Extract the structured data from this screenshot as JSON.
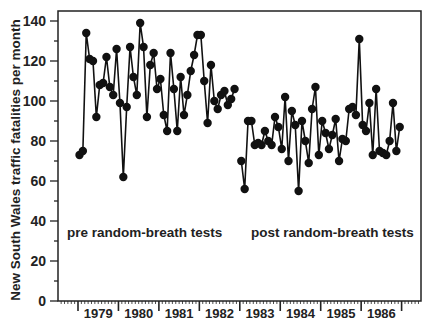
{
  "chart_data": {
    "type": "line",
    "title": "",
    "xlabel": "",
    "ylabel": "New South Wales traffic fatalities per month",
    "ylim": [
      0,
      140
    ],
    "yticks": [
      0,
      20,
      40,
      60,
      80,
      100,
      120,
      140
    ],
    "xticks": [
      "1979",
      "1980",
      "1981",
      "1982",
      "1983",
      "1984",
      "1985",
      "1986"
    ],
    "grid": false,
    "legend": null,
    "annotations": [
      {
        "text": "pre random-breath tests"
      },
      {
        "text": "post random-breath tests"
      }
    ],
    "series": [
      {
        "name": "pre random-breath tests",
        "start_month_index": 0,
        "values": [
          73,
          75,
          134,
          121,
          120,
          92,
          108,
          109,
          122,
          107,
          103,
          126,
          99,
          62,
          97,
          127,
          112,
          103,
          139,
          127,
          92,
          118,
          124,
          106,
          111,
          93,
          85,
          124,
          106,
          85,
          112,
          93,
          103,
          115,
          123,
          133,
          133,
          110,
          89,
          118,
          100,
          96,
          103,
          105,
          98,
          101,
          106
        ]
      },
      {
        "name": "post random-breath tests",
        "start_month_index": 48,
        "values": [
          70,
          56,
          90,
          90,
          78,
          79,
          78,
          85,
          80,
          78,
          92,
          87,
          76,
          102,
          70,
          95,
          88,
          55,
          90,
          80,
          69,
          96,
          107,
          73,
          90,
          84,
          76,
          83,
          91,
          70,
          81,
          80,
          96,
          97,
          93,
          131,
          88,
          85,
          99,
          73,
          106,
          75,
          74,
          73,
          80,
          99,
          75,
          87
        ]
      }
    ]
  },
  "labels": {
    "ylabel": "New South Wales traffic fatalities per month",
    "pre": "pre random-breath tests",
    "post": "post random-breath tests"
  }
}
